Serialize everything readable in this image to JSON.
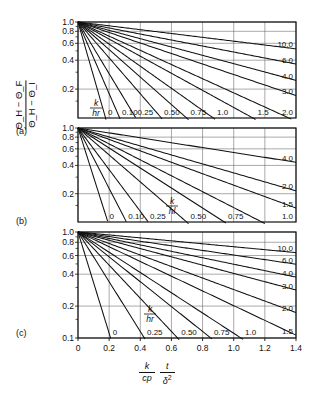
{
  "figure": {
    "ylabel": {
      "num": "Θ_H − Θ_F",
      "den": "Θ_H − Θ_I",
      "num_parts": [
        "Θ",
        "H",
        "−",
        "Θ",
        "F"
      ],
      "den_parts": [
        "Θ",
        "H",
        "−",
        "Θ",
        "I"
      ]
    },
    "xlabel": {
      "frac1_num": "k",
      "frac1_den": "cp",
      "frac2_num": "t",
      "frac2_den": "δ",
      "frac2_den_sup": "2"
    },
    "panel_letters": [
      "(a)",
      "(b)",
      "(c)"
    ]
  },
  "chart_data": [
    {
      "type": "line",
      "panel": "(a)",
      "title": "",
      "xlabel": "(k/cp)(t/δ²)",
      "ylabel": "(Θ_H − Θ_F)/(Θ_H − Θ_I)",
      "xlim": [
        0,
        1.4
      ],
      "ylim": [
        0.1,
        1.0
      ],
      "yscale": "log",
      "grid": true,
      "xticks": [
        0,
        0.2,
        0.4,
        0.6,
        0.8,
        1.0,
        1.2,
        1.4
      ],
      "xticklabels": [
        "0",
        "0.2",
        "0.4",
        "0.6",
        "0.8",
        "1.0",
        "1.2",
        "1.4"
      ],
      "yticks": [
        1.0,
        0.8,
        0.6,
        0.4,
        0.2
      ],
      "yticklabels": [
        "1.0",
        "0.8",
        "0.6",
        "0.4",
        "0.2"
      ],
      "parameter_symbol": {
        "num": "k",
        "den": "hr"
      },
      "legend_position": "inline-curve-labels",
      "series": [
        {
          "name": "0",
          "label": "0",
          "decay": 13.0
        },
        {
          "name": "0.10",
          "label": "0.10",
          "decay": 8.6
        },
        {
          "name": "0.25",
          "label": "0.25",
          "decay": 6.2
        },
        {
          "name": "0.50",
          "label": "0.50",
          "decay": 4.3
        },
        {
          "name": "0.75",
          "label": "0.75",
          "decay": 3.3
        },
        {
          "name": "1.0",
          "label": "1.0",
          "decay": 2.65
        },
        {
          "name": "1.5",
          "label": "1.5",
          "decay": 2.05
        },
        {
          "name": "2.0",
          "label": "2.0",
          "decay": 1.7
        },
        {
          "name": "3.0",
          "label": "3.0",
          "decay": 1.26
        },
        {
          "name": "4.0",
          "label": "4.0",
          "decay": 1.0
        },
        {
          "name": "6.0",
          "label": "6.0",
          "decay": 0.72
        },
        {
          "name": "10.0",
          "label": "10.0",
          "decay": 0.46
        }
      ]
    },
    {
      "type": "line",
      "panel": "(b)",
      "title": "",
      "xlabel": "(k/cp)(t/δ²)",
      "ylabel": "(Θ_H − Θ_F)/(Θ_H − Θ_I)",
      "xlim": [
        0,
        1.4
      ],
      "ylim": [
        0.1,
        1.0
      ],
      "yscale": "log",
      "grid": true,
      "xticks": [
        0,
        0.2,
        0.4,
        0.6,
        0.8,
        1.0,
        1.2,
        1.4
      ],
      "xticklabels": [
        "0",
        "0.2",
        "0.4",
        "0.6",
        "0.8",
        "1.0",
        "1.2",
        "1.4"
      ],
      "yticks": [
        1.0,
        0.8,
        0.6,
        0.4,
        0.2
      ],
      "yticklabels": [
        "1.0",
        "0.8",
        "0.6",
        "0.4",
        "0.2"
      ],
      "parameter_symbol": {
        "num": "k",
        "den": "hl"
      },
      "legend_position": "inline-curve-labels",
      "series": [
        {
          "name": "0",
          "label": "0",
          "decay": 12.0
        },
        {
          "name": "0.10",
          "label": "0.10",
          "decay": 7.4
        },
        {
          "name": "0.25",
          "label": "0.25",
          "decay": 5.1
        },
        {
          "name": "0.50",
          "label": "0.50",
          "decay": 3.3
        },
        {
          "name": "0.75",
          "label": "0.75",
          "decay": 2.45
        },
        {
          "name": "1.0",
          "label": "1.0",
          "decay": 1.95
        },
        {
          "name": "1.5",
          "label": "1.5",
          "decay": 1.4
        },
        {
          "name": "2.0",
          "label": "2.0",
          "decay": 1.1
        },
        {
          "name": "4.0",
          "label": "4.0",
          "decay": 0.6
        }
      ]
    },
    {
      "type": "line",
      "panel": "(c)",
      "title": "",
      "xlabel": "(k/cp)(t/δ²)",
      "ylabel": "(Θ_H − Θ_F)/(Θ_H − Θ_I)",
      "xlim": [
        0,
        1.4
      ],
      "ylim": [
        0.1,
        1.0
      ],
      "yscale": "log",
      "grid": true,
      "xticks": [
        0,
        0.2,
        0.4,
        0.6,
        0.8,
        1.0,
        1.2,
        1.4
      ],
      "xticklabels": [
        "0",
        "0.2",
        "0.4",
        "0.6",
        "0.8",
        "1.0",
        "1.2",
        "1.4"
      ],
      "yticks": [
        1.0,
        0.8,
        0.6,
        0.4,
        0.2,
        0.1
      ],
      "yticklabels": [
        "1.0",
        "0.8",
        "0.6",
        "0.4",
        "0.2",
        "0.1"
      ],
      "parameter_symbol": {
        "num": "k",
        "den": "hr"
      },
      "legend_position": "inline-curve-labels",
      "series": [
        {
          "name": "0",
          "label": "0",
          "decay": 11.0
        },
        {
          "name": "0.25",
          "label": "0.25",
          "decay": 5.4
        },
        {
          "name": "0.50",
          "label": "0.50",
          "decay": 3.6
        },
        {
          "name": "0.75",
          "label": "0.75",
          "decay": 2.7
        },
        {
          "name": "1.0",
          "label": "1.0",
          "decay": 2.2
        },
        {
          "name": "1.5",
          "label": "1.5",
          "decay": 1.6
        },
        {
          "name": "2.0",
          "label": "2.0",
          "decay": 1.25
        },
        {
          "name": "3.0",
          "label": "3.0",
          "decay": 0.9
        },
        {
          "name": "4.0",
          "label": "4.0",
          "decay": 0.7
        },
        {
          "name": "6.0",
          "label": "6.0",
          "decay": 0.5
        },
        {
          "name": "10.0",
          "label": "10.0",
          "decay": 0.32
        }
      ]
    }
  ]
}
